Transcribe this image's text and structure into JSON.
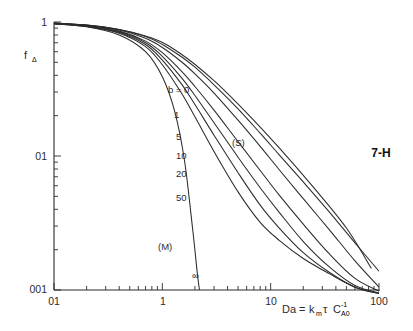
{
  "figure": {
    "corner_label": "7-H",
    "background": "#ffffff",
    "line_color": "#2b2b2b"
  },
  "axes": {
    "y_axis_label": "f",
    "y_axis_label_sub": "Δ",
    "y_ticks": [
      "1",
      "01",
      "001"
    ],
    "y_tick_values": [
      1,
      0.1,
      0.01
    ],
    "x_ticks": [
      "01",
      "1",
      "10",
      "100"
    ],
    "x_tick_values": [
      0.1,
      1,
      10,
      100
    ],
    "x_axis_label_main": "Da",
    "x_axis_label_eq": "=",
    "x_axis_label_k": "k",
    "x_axis_label_k_sub": "m",
    "x_axis_label_tau": "τ",
    "x_axis_label_c": "C",
    "x_axis_label_c_sub": "A0",
    "x_axis_label_c_sup": "-1"
  },
  "annotations": [
    {
      "name": "label-b-0",
      "text": "b = 0",
      "x": 168,
      "y": 93
    },
    {
      "name": "label-b-1",
      "text": "1",
      "x": 174,
      "y": 118
    },
    {
      "name": "label-b-5",
      "text": "5",
      "x": 176,
      "y": 140
    },
    {
      "name": "label-b-10",
      "text": "10",
      "x": 176,
      "y": 159
    },
    {
      "name": "label-b-20",
      "text": "20",
      "x": 176,
      "y": 177
    },
    {
      "name": "label-b-50",
      "text": "50",
      "x": 176,
      "y": 201
    },
    {
      "name": "label-model-s",
      "text": "(S)",
      "x": 232,
      "y": 146
    },
    {
      "name": "label-model-m",
      "text": "(M)",
      "x": 158,
      "y": 250
    },
    {
      "name": "label-b-inf",
      "text": "∞",
      "x": 192,
      "y": 279
    }
  ],
  "chart_data": {
    "type": "line",
    "title": "",
    "xlabel": "Da = km τ CA0⁻¹",
    "ylabel": "fΔ",
    "xscale": "log",
    "yscale": "log",
    "xlim": [
      0.1,
      100
    ],
    "ylim": [
      0.01,
      1
    ],
    "grid": false,
    "legend": "inline-curve-labels",
    "series": [
      {
        "name": "b = 0",
        "label": "b = 0",
        "x": [
          0.1,
          0.2,
          0.4,
          0.7,
          1.0,
          1.5,
          2.0,
          3.0,
          5.0,
          8.0,
          12.0,
          20.0,
          35.0,
          60.0,
          100.0
        ],
        "y": [
          0.98,
          0.95,
          0.88,
          0.78,
          0.68,
          0.55,
          0.46,
          0.34,
          0.225,
          0.148,
          0.102,
          0.064,
          0.038,
          0.0225,
          0.0138
        ]
      },
      {
        "name": "b = 1",
        "label": "1",
        "x": [
          0.1,
          0.2,
          0.4,
          0.7,
          1.0,
          1.5,
          2.0,
          3.0,
          5.0,
          8.0,
          12.0,
          20.0,
          35.0,
          60.0,
          100.0
        ],
        "y": [
          0.98,
          0.945,
          0.87,
          0.755,
          0.645,
          0.505,
          0.41,
          0.295,
          0.185,
          0.118,
          0.079,
          0.048,
          0.028,
          0.0165,
          0.0105
        ]
      },
      {
        "name": "b = 5",
        "label": "5",
        "x": [
          0.1,
          0.2,
          0.4,
          0.7,
          1.0,
          1.5,
          2.0,
          3.0,
          5.0,
          8.0,
          12.0,
          20.0,
          35.0,
          60.0,
          100.0
        ],
        "y": [
          0.975,
          0.94,
          0.855,
          0.72,
          0.59,
          0.43,
          0.33,
          0.22,
          0.128,
          0.078,
          0.051,
          0.031,
          0.0185,
          0.0122,
          0.0098
        ]
      },
      {
        "name": "b = 10",
        "label": "10",
        "x": [
          0.1,
          0.2,
          0.4,
          0.7,
          1.0,
          1.5,
          2.0,
          3.0,
          5.0,
          8.0,
          12.0,
          20.0,
          35.0,
          60.0,
          100.0
        ],
        "y": [
          0.975,
          0.935,
          0.845,
          0.7,
          0.555,
          0.385,
          0.283,
          0.177,
          0.098,
          0.058,
          0.038,
          0.023,
          0.0148,
          0.0108,
          0.0095
        ]
      },
      {
        "name": "b = 20",
        "label": "20",
        "x": [
          0.1,
          0.2,
          0.4,
          0.7,
          1.0,
          1.5,
          2.0,
          3.0,
          5.0,
          8.0,
          12.0,
          20.0,
          35.0,
          60.0,
          100.0
        ],
        "y": [
          0.972,
          0.93,
          0.835,
          0.68,
          0.52,
          0.345,
          0.242,
          0.143,
          0.075,
          0.043,
          0.029,
          0.019,
          0.0135,
          0.0105,
          0.0094
        ]
      },
      {
        "name": "b = 50",
        "label": "50",
        "x": [
          0.1,
          0.2,
          0.4,
          0.7,
          1.0,
          1.5,
          2.0,
          3.0,
          5.0,
          8.0,
          12.0,
          20.0,
          35.0,
          60.0,
          100.0
        ],
        "y": [
          0.97,
          0.925,
          0.825,
          0.655,
          0.48,
          0.295,
          0.196,
          0.108,
          0.054,
          0.032,
          0.0235,
          0.0172,
          0.0132,
          0.0105,
          0.0094
        ]
      },
      {
        "name": "b = infinity",
        "label": "∞",
        "x": [
          0.1,
          0.2,
          0.4,
          0.7,
          1.0,
          1.3,
          1.6,
          1.9,
          2.1,
          2.2
        ],
        "y": [
          0.97,
          0.92,
          0.8,
          0.6,
          0.39,
          0.215,
          0.093,
          0.029,
          0.0135,
          0.01
        ]
      },
      {
        "name": "model-S-envelope",
        "label": "(S)",
        "x": [
          0.1,
          0.3,
          0.8,
          1.5,
          3.0,
          6.0,
          12.0,
          25.0,
          50.0,
          85.0
        ],
        "y": [
          0.985,
          0.915,
          0.76,
          0.575,
          0.365,
          0.21,
          0.115,
          0.058,
          0.029,
          0.0145
        ]
      }
    ]
  }
}
